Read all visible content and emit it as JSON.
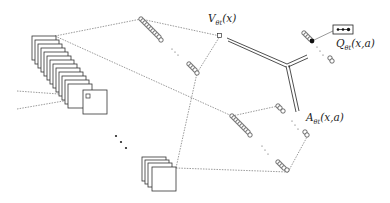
{
  "diagram": {
    "labels": {
      "value_main": "V",
      "value_sub": "θt",
      "value_args": "(x)",
      "advantage_main": "A",
      "advantage_sub": "θt",
      "advantage_args": "(x,a)",
      "q_main": "Q",
      "q_sub": "θt",
      "q_args": "(x,a)"
    },
    "nodes": [
      {
        "id": "input-stack",
        "type": "feature-map-stack",
        "count": 14
      },
      {
        "id": "conv-stack-small",
        "type": "feature-map-stack",
        "count": 4
      },
      {
        "id": "value-hidden-top",
        "type": "neuron-column"
      },
      {
        "id": "value-hidden-bottom",
        "type": "neuron-column"
      },
      {
        "id": "value-output",
        "type": "single-unit"
      },
      {
        "id": "advantage-hidden-top",
        "type": "neuron-column"
      },
      {
        "id": "advantage-hidden-bottom",
        "type": "neuron-column"
      },
      {
        "id": "advantage-output-top",
        "type": "neuron-column"
      },
      {
        "id": "advantage-output-bottom",
        "type": "neuron-column"
      },
      {
        "id": "aggregation-junction",
        "type": "merge"
      },
      {
        "id": "q-output",
        "type": "neuron-column"
      },
      {
        "id": "q-selected",
        "type": "filled-unit"
      },
      {
        "id": "q-action-box",
        "type": "box",
        "content": "•••"
      }
    ],
    "colors": {
      "line": "#333333",
      "dashed": "#555555",
      "background": "#ffffff"
    }
  }
}
